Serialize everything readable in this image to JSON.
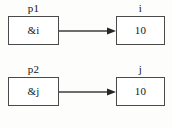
{
  "diagram": {
    "type": "pointer-memory-diagram",
    "title": "",
    "stroke_color": "#4a4a4a",
    "text_color": "#141414",
    "background_color": "#ffffff",
    "rows": [
      {
        "id": "row-1",
        "pointer": {
          "label": "p1",
          "value": "&i",
          "icon": "pointer-box"
        },
        "target": {
          "label": "i",
          "value": "10",
          "icon": "value-box"
        },
        "arrow": {
          "icon": "arrow-right-icon",
          "from": "p1",
          "to": "i"
        }
      },
      {
        "id": "row-2",
        "pointer": {
          "label": "p2",
          "value": "&j",
          "icon": "pointer-box"
        },
        "target": {
          "label": "j",
          "value": "10",
          "icon": "value-box"
        },
        "arrow": {
          "icon": "arrow-right-icon",
          "from": "p2",
          "to": "j"
        }
      }
    ]
  }
}
